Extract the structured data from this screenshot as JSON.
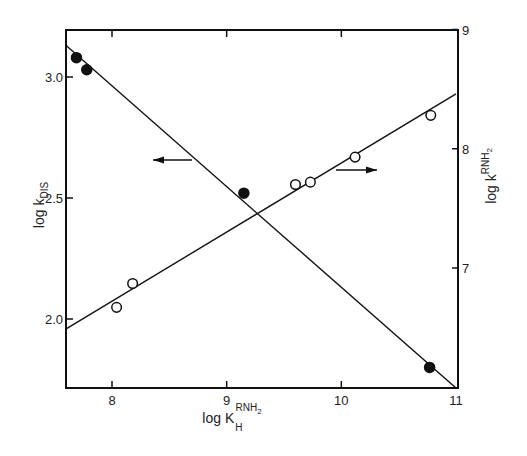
{
  "chart_data": {
    "type": "scatter",
    "title": "",
    "xlabel": "log K_H^RNH2",
    "xlabel_parts": {
      "base": "log K",
      "sup": "RNH",
      "sup_sub": "2",
      "sub": "H"
    },
    "ylabel_left": "log k_DIS",
    "ylabel_left_parts": {
      "base": "log k",
      "sub": "DIS"
    },
    "ylabel_right": "log k^RNH2",
    "ylabel_right_parts": {
      "base": "log k",
      "sup": "RNH",
      "sup_sub": "2"
    },
    "xlim": [
      7.6,
      11.0
    ],
    "ylim_left": [
      1.68,
      3.2
    ],
    "ylim_right": [
      6.0,
      9.0
    ],
    "x_ticks": [
      {
        "value": 8,
        "label": "8"
      },
      {
        "value": 9,
        "label": "9"
      },
      {
        "value": 10,
        "label": "10"
      },
      {
        "value": 11,
        "label": "11"
      }
    ],
    "y_ticks_left": [
      {
        "value": 3.0,
        "label": "3.0"
      },
      {
        "value": 2.5,
        "label": "2.5"
      },
      {
        "value": 2.0,
        "label": "2.0"
      }
    ],
    "y_ticks_right": [
      {
        "value": 9,
        "label": "9"
      },
      {
        "value": 8,
        "label": "8"
      },
      {
        "value": 7,
        "label": "7"
      }
    ],
    "grid": false,
    "legend": null,
    "series": [
      {
        "name": "log k_DIS",
        "axis": "left",
        "marker": "filled-circle",
        "x": [
          7.69,
          7.78,
          9.15,
          10.77
        ],
        "y": [
          3.08,
          3.03,
          2.52,
          1.8
        ],
        "fit_line": {
          "x": [
            7.6,
            11.0
          ],
          "y": [
            3.13,
            1.71
          ]
        },
        "annotation": "arrow pointing left (uses left axis)"
      },
      {
        "name": "log k^RNH2",
        "axis": "right",
        "marker": "open-circle",
        "x": [
          8.04,
          8.18,
          9.6,
          9.73,
          10.12,
          10.78
        ],
        "y": [
          6.67,
          6.87,
          7.7,
          7.72,
          7.93,
          8.28
        ],
        "fit_line": {
          "x": [
            7.6,
            11.0
          ],
          "y": [
            6.49,
            8.46
          ]
        },
        "annotation": "arrow pointing right (uses right axis)"
      }
    ],
    "annotations": [
      {
        "type": "arrow",
        "direction": "left",
        "near_series": "log k_DIS"
      },
      {
        "type": "arrow",
        "direction": "right",
        "near_series": "log k^RNH2"
      }
    ]
  },
  "layout": {
    "plot": {
      "left": 66,
      "top": 30,
      "right": 458,
      "bottom": 388
    },
    "x_px": {
      "v0": 8,
      "p0": 112,
      "v1": 11,
      "p1": 456
    },
    "yl_px": {
      "v0": 3.0,
      "p0": 77,
      "v1": 2.0,
      "p1": 319
    },
    "yr_px": {
      "v0": 9,
      "p0": 29.5,
      "v1": 7,
      "p1": 268
    },
    "arrow_left": {
      "x1": 192,
      "x2": 153,
      "y": 160
    },
    "arrow_right": {
      "x1": 336,
      "x2": 377,
      "y": 170
    },
    "ink_color": "#111111"
  }
}
